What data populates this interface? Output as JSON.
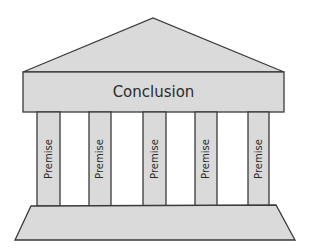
{
  "diagram": {
    "roof": {
      "shape": "triangle"
    },
    "entablature": {
      "label": "Conclusion"
    },
    "columns": [
      {
        "label": "Premise"
      },
      {
        "label": "Premise"
      },
      {
        "label": "Premise"
      },
      {
        "label": "Premise"
      },
      {
        "label": "Premise"
      }
    ],
    "base": {
      "shape": "trapezoid"
    },
    "colors": {
      "fill": "#dadada",
      "stroke": "#3a3a3a",
      "background": "#ffffff"
    }
  }
}
